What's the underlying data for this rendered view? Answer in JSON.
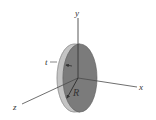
{
  "diagram": {
    "labels": {
      "y_axis": "y",
      "x_axis": "x",
      "z_axis": "z",
      "thickness": "t",
      "radius": "R"
    },
    "colors": {
      "background": "#ffffff",
      "face": "#7b7b7b",
      "rim": "#c4c4c4",
      "rim_edge": "#9a9a9a",
      "axis": "#4a4a4a",
      "text": "#333333"
    }
  }
}
